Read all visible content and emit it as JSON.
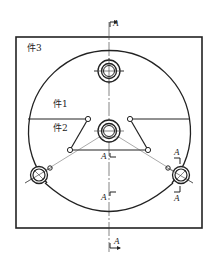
{
  "drawing": {
    "parts": {
      "part1": "件1",
      "part2": "件2",
      "part3": "件3"
    },
    "section_marks": {
      "top": "A",
      "bottom": "A",
      "center_upper": "A",
      "center_lower": "A",
      "right_upper": "A",
      "right_lower": "A"
    },
    "colors": {
      "line": "#222222",
      "background": "#ffffff"
    }
  }
}
